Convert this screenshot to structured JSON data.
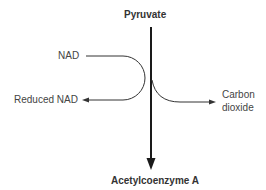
{
  "diagram": {
    "type": "reaction-flow",
    "nodes": {
      "substrate": "Pyruvate",
      "product": "Acetylcoenzyme A",
      "coenzyme_in": "NAD",
      "coenzyme_out": "Reduced NAD",
      "byproduct_line1": "Carbon",
      "byproduct_line2": "dioxide"
    },
    "edges": [
      {
        "from": "Pyruvate",
        "to": "Acetylcoenzyme A"
      },
      {
        "from": "NAD",
        "to": "Reduced NAD"
      },
      {
        "from": "Pyruvate",
        "to": "Carbon dioxide"
      }
    ],
    "colors": {
      "line": "#2b2b2b",
      "text": "#444444",
      "background": "#ffffff"
    }
  }
}
